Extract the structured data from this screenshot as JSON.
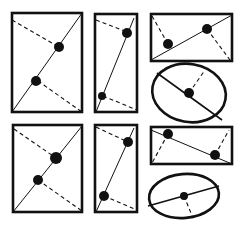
{
  "diagram": {
    "colors": {
      "stroke": "#111111",
      "background": "#ffffff"
    },
    "figures": [
      {
        "id": "rect-top-left",
        "shape": "rect",
        "x": 12,
        "y": 13,
        "w": 70,
        "h": 99,
        "solid": [
          12,
          112,
          82,
          13
        ],
        "dashed": [
          [
            12,
            20,
            59,
            47
          ],
          [
            38,
            81,
            82,
            112
          ]
        ],
        "dots": [
          [
            59,
            47,
            5
          ],
          [
            36,
            81,
            5
          ]
        ]
      },
      {
        "id": "rect-top-middle",
        "shape": "rect",
        "x": 95,
        "y": 14,
        "w": 42,
        "h": 98,
        "solid": [
          96,
          112,
          134,
          18
        ],
        "dashed": [
          [
            96,
            20,
            127,
            32
          ],
          [
            103,
            96,
            137,
            110
          ]
        ],
        "dots": [
          [
            127,
            33,
            5
          ],
          [
            102,
            96,
            4
          ]
        ]
      },
      {
        "id": "rect-top-right",
        "shape": "rect",
        "x": 151,
        "y": 14,
        "w": 81,
        "h": 47,
        "solid": [
          151,
          60,
          232,
          15
        ],
        "dashed": [
          [
            152,
            16,
            168,
            44
          ],
          [
            207,
            29,
            230,
            60
          ]
        ],
        "dots": [
          [
            168,
            44,
            5
          ],
          [
            207,
            29,
            5
          ]
        ]
      },
      {
        "id": "ellipse-top-right",
        "shape": "ellipse",
        "cx": 189,
        "cy": 93,
        "rx": 37,
        "ry": 29,
        "rot": 10,
        "solid": [
          157,
          73,
          222,
          120
        ],
        "dashed": [
          [
            189,
            93,
            205,
            70
          ]
        ],
        "dots": [
          [
            189,
            93,
            5
          ]
        ]
      },
      {
        "id": "rect-bottom-left",
        "shape": "rect",
        "x": 13,
        "y": 125,
        "w": 69,
        "h": 87,
        "solid": [
          13,
          212,
          82,
          126
        ],
        "dashed": [
          [
            14,
            129,
            56,
            158
          ],
          [
            38,
            180,
            82,
            211
          ]
        ],
        "dots": [
          [
            56,
            158,
            6
          ],
          [
            38,
            180,
            5
          ]
        ]
      },
      {
        "id": "rect-bottom-middle",
        "shape": "rect",
        "x": 95,
        "y": 125,
        "w": 42,
        "h": 87,
        "solid": [
          96,
          212,
          134,
          128
        ],
        "dashed": [
          [
            96,
            127,
            128,
            142
          ],
          [
            104,
            196,
            137,
            210
          ]
        ],
        "dots": [
          [
            128,
            142,
            5
          ],
          [
            104,
            196,
            5
          ]
        ]
      },
      {
        "id": "rect-bottom-right",
        "shape": "rect",
        "x": 151,
        "y": 127,
        "w": 81,
        "h": 37,
        "solid": [
          151,
          130,
          232,
          164
        ],
        "dashed": [
          [
            168,
            134,
            152,
            163
          ],
          [
            215,
            155,
            229,
            130
          ]
        ],
        "dots": [
          [
            168,
            134,
            5
          ],
          [
            215,
            155,
            5
          ]
        ]
      },
      {
        "id": "ellipse-bottom-right",
        "shape": "ellipse",
        "cx": 184,
        "cy": 196,
        "rx": 35,
        "ry": 22,
        "rot": -5,
        "solid": [
          148,
          206,
          219,
          186
        ],
        "dashed": [
          [
            184,
            196,
            193,
            218
          ]
        ],
        "dots": [
          [
            184,
            196,
            4
          ]
        ]
      }
    ]
  }
}
